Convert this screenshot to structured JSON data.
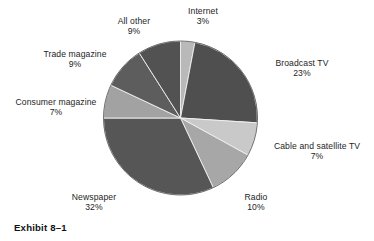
{
  "caption": "Exhibit 8–1",
  "chart_data": {
    "type": "pie",
    "title": "",
    "xlabel": "",
    "ylabel": "",
    "legend_position": "none",
    "grid": false,
    "start_angle_deg": 0,
    "direction": "clockwise",
    "units": "percent",
    "total": 100,
    "categories": [
      "Internet",
      "Broadcast TV",
      "Cable and satellite TV",
      "Radio",
      "Newspaper",
      "Consumer magazine",
      "Trade magazine",
      "All other"
    ],
    "values": [
      3,
      23,
      7,
      10,
      32,
      7,
      9,
      9
    ],
    "value_labels": [
      "3%",
      "23%",
      "7%",
      "10%",
      "32%",
      "7%",
      "9%",
      "9%"
    ],
    "colors": [
      "#b9b9b9",
      "#4f4f4f",
      "#c9c9c9",
      "#a7a7a7",
      "#565656",
      "#a2a2a2",
      "#5d5d5d",
      "#525252"
    ],
    "slices": [
      {
        "label": "Internet",
        "value": 3,
        "value_label": "3%",
        "color": "#b9b9b9"
      },
      {
        "label": "Broadcast TV",
        "value": 23,
        "value_label": "23%",
        "color": "#4f4f4f"
      },
      {
        "label": "Cable and satellite TV",
        "value": 7,
        "value_label": "7%",
        "color": "#c9c9c9"
      },
      {
        "label": "Radio",
        "value": 10,
        "value_label": "10%",
        "color": "#a7a7a7"
      },
      {
        "label": "Newspaper",
        "value": 32,
        "value_label": "32%",
        "color": "#565656"
      },
      {
        "label": "Consumer magazine",
        "value": 7,
        "value_label": "7%",
        "color": "#a2a2a2"
      },
      {
        "label": "Trade magazine",
        "value": 9,
        "value_label": "9%",
        "color": "#5d5d5d"
      },
      {
        "label": "All other",
        "value": 9,
        "value_label": "9%",
        "color": "#525252"
      }
    ]
  }
}
